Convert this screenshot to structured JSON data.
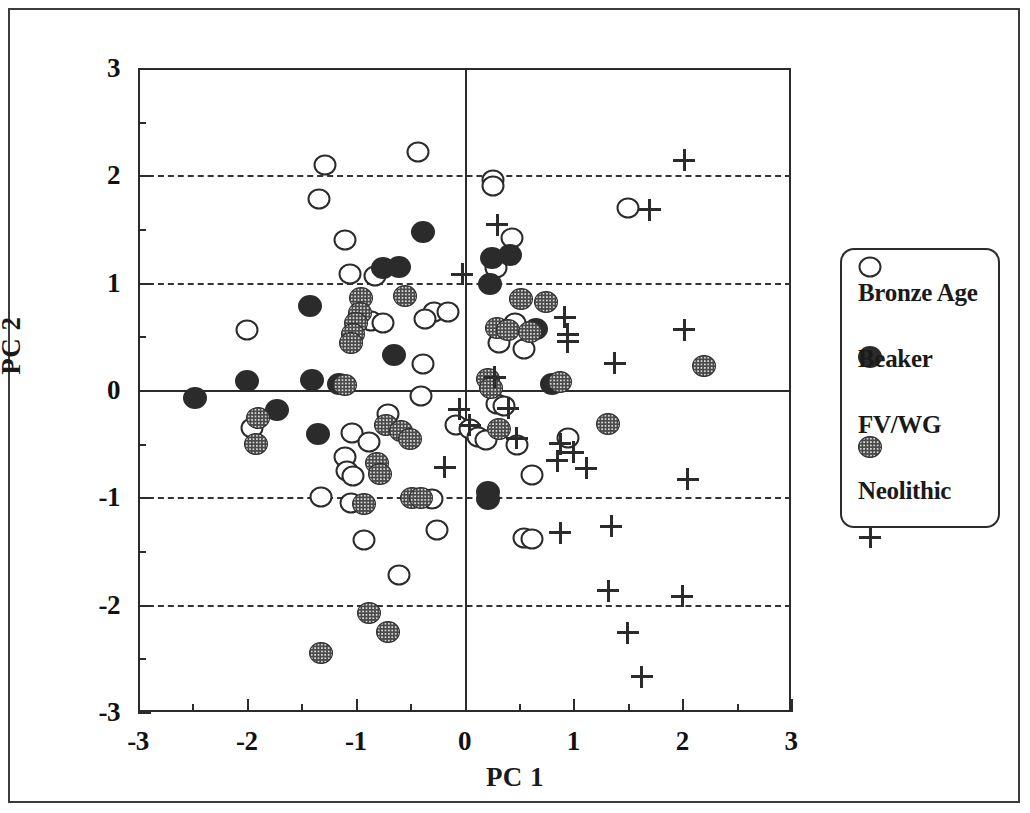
{
  "figure": {
    "xlabel": "PC 1",
    "ylabel": "PC 2",
    "x_ticklabels": [
      "-3",
      "-2",
      "-1",
      "0",
      "1",
      "2",
      "3"
    ],
    "y_ticklabels": [
      "3",
      "2",
      "1",
      "0",
      "-1",
      "-2",
      "-3"
    ]
  },
  "legend": {
    "entries": [
      {
        "symbol": "open-circle",
        "label": "Bronze Age"
      },
      {
        "symbol": "filled-circle",
        "label": "Beaker"
      },
      {
        "symbol": "stippled-circle",
        "label": "FV/WG"
      },
      {
        "symbol": "plus",
        "label": "Neolithic"
      }
    ]
  },
  "chart_data": {
    "type": "scatter",
    "title": "",
    "xlabel": "PC 1",
    "ylabel": "PC 2",
    "xlim": [
      -3,
      3
    ],
    "ylim": [
      -3,
      3
    ],
    "xticks": [
      -3,
      -2,
      -1,
      0,
      1,
      2,
      3
    ],
    "yticks": [
      -3,
      -2,
      -1,
      0,
      1,
      2,
      3
    ],
    "minor_tick_step": 0.5,
    "grid": "horizontal dashed at y = 2, 1, -1, -2; solid axis lines at x = 0 and y = 0",
    "legend_position": "right, outside axes",
    "series": [
      {
        "name": "Bronze Age",
        "marker": "open-circle",
        "points": [
          [
            -1.28,
            2.1
          ],
          [
            -0.43,
            2.22
          ],
          [
            -1.34,
            1.78
          ],
          [
            0.26,
            1.96
          ],
          [
            0.26,
            1.9
          ],
          [
            -1.1,
            1.4
          ],
          [
            0.44,
            1.42
          ],
          [
            1.5,
            1.7
          ],
          [
            -1.05,
            1.08
          ],
          [
            -0.82,
            1.06
          ],
          [
            0.29,
            1.14
          ],
          [
            -2.0,
            0.56
          ],
          [
            -0.97,
            0.68
          ],
          [
            -0.86,
            0.64
          ],
          [
            -0.75,
            0.62
          ],
          [
            -0.28,
            0.73
          ],
          [
            -0.15,
            0.73
          ],
          [
            -0.36,
            0.66
          ],
          [
            0.46,
            0.62
          ],
          [
            -0.38,
            0.24
          ],
          [
            0.55,
            0.38
          ],
          [
            0.32,
            0.44
          ],
          [
            -0.4,
            -0.06
          ],
          [
            0.3,
            -0.13
          ],
          [
            0.36,
            -0.15
          ],
          [
            -1.32,
            -1.0
          ],
          [
            -0.3,
            -1.02
          ],
          [
            -1.95,
            -0.35
          ],
          [
            -0.7,
            -0.22
          ],
          [
            -1.03,
            -0.4
          ],
          [
            -0.88,
            -0.48
          ],
          [
            -1.1,
            -0.62
          ],
          [
            -1.08,
            -0.75
          ],
          [
            -1.02,
            -0.8
          ],
          [
            -0.08,
            -0.33
          ],
          [
            0.05,
            -0.36
          ],
          [
            0.12,
            -0.44
          ],
          [
            0.2,
            -0.47
          ],
          [
            0.48,
            -0.51
          ],
          [
            0.95,
            -0.45
          ],
          [
            0.62,
            -0.79
          ],
          [
            -0.25,
            -1.3
          ],
          [
            -0.92,
            -1.4
          ],
          [
            -0.6,
            -1.72
          ],
          [
            0.55,
            -1.38
          ],
          [
            0.62,
            -1.39
          ],
          [
            -1.04,
            -1.05
          ]
        ]
      },
      {
        "name": "Beaker",
        "marker": "filled-circle",
        "points": [
          [
            -0.38,
            1.47
          ],
          [
            -0.6,
            1.15
          ],
          [
            -0.75,
            1.14
          ],
          [
            0.42,
            1.26
          ],
          [
            0.25,
            1.23
          ],
          [
            0.23,
            0.99
          ],
          [
            -1.42,
            0.78
          ],
          [
            0.66,
            0.57
          ],
          [
            -0.65,
            0.33
          ],
          [
            -2.48,
            -0.07
          ],
          [
            -2.0,
            0.08
          ],
          [
            -1.4,
            0.09
          ],
          [
            -1.15,
            0.06
          ],
          [
            0.8,
            0.06
          ],
          [
            -1.72,
            -0.19
          ],
          [
            -1.35,
            -0.41
          ],
          [
            0.22,
            -0.95
          ],
          [
            0.22,
            -1.02
          ]
        ]
      },
      {
        "name": "FV/WG",
        "marker": "stippled-circle",
        "points": [
          [
            -0.95,
            0.86
          ],
          [
            -0.55,
            0.88
          ],
          [
            0.52,
            0.85
          ],
          [
            0.75,
            0.82
          ],
          [
            -0.96,
            0.72
          ],
          [
            -1.0,
            0.62
          ],
          [
            -1.02,
            0.52
          ],
          [
            -1.04,
            0.44
          ],
          [
            0.3,
            0.58
          ],
          [
            0.4,
            0.56
          ],
          [
            0.6,
            0.54
          ],
          [
            2.2,
            0.22
          ],
          [
            -1.1,
            0.05
          ],
          [
            0.22,
            0.1
          ],
          [
            0.24,
            0.02
          ],
          [
            0.88,
            0.07
          ],
          [
            -1.9,
            -0.26
          ],
          [
            -1.92,
            -0.5
          ],
          [
            -0.72,
            -0.33
          ],
          [
            -0.58,
            -0.38
          ],
          [
            -0.5,
            -0.46
          ],
          [
            0.32,
            -0.36
          ],
          [
            1.32,
            -0.32
          ],
          [
            -0.8,
            -0.68
          ],
          [
            -0.78,
            -0.78
          ],
          [
            -0.92,
            -1.06
          ],
          [
            -0.48,
            -1.01
          ],
          [
            -0.4,
            -1.01
          ],
          [
            -0.88,
            -2.08
          ],
          [
            -0.7,
            -2.25
          ],
          [
            -1.32,
            -2.45
          ]
        ]
      },
      {
        "name": "Neolithic",
        "marker": "plus",
        "points": [
          [
            2.02,
            2.14
          ],
          [
            1.7,
            1.68
          ],
          [
            0.3,
            1.54
          ],
          [
            -0.02,
            1.08
          ],
          [
            0.92,
            0.68
          ],
          [
            0.95,
            0.52
          ],
          [
            0.95,
            0.45
          ],
          [
            2.02,
            0.56
          ],
          [
            1.38,
            0.25
          ],
          [
            0.28,
            0.12
          ],
          [
            -0.05,
            -0.18
          ],
          [
            0.4,
            -0.17
          ],
          [
            0.05,
            -0.33
          ],
          [
            0.48,
            -0.45
          ],
          [
            0.88,
            -0.5
          ],
          [
            1.0,
            -0.58
          ],
          [
            -0.18,
            -0.72
          ],
          [
            0.85,
            -0.66
          ],
          [
            1.12,
            -0.73
          ],
          [
            2.05,
            -0.83
          ],
          [
            0.88,
            -1.33
          ],
          [
            1.35,
            -1.27
          ],
          [
            1.32,
            -1.87
          ],
          [
            2.0,
            -1.92
          ],
          [
            1.5,
            -2.26
          ],
          [
            1.63,
            -2.67
          ]
        ]
      }
    ]
  }
}
